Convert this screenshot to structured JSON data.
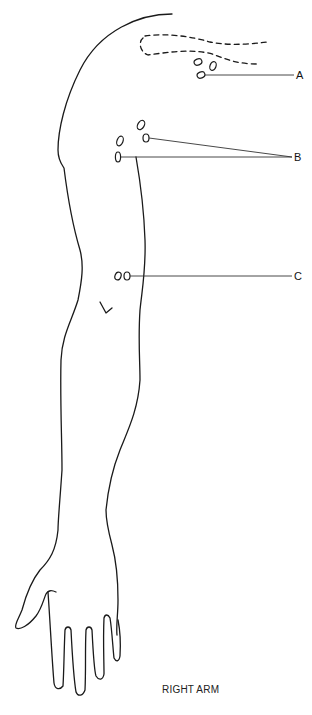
{
  "diagram": {
    "title": "RIGHT ARM",
    "labels": [
      {
        "id": "A",
        "text": "A"
      },
      {
        "id": "B",
        "text": "B"
      },
      {
        "id": "C",
        "text": "C"
      }
    ],
    "markers": {
      "A": {
        "count": 4,
        "description": "cluster of sites near shoulder, below dashed region"
      },
      "B": {
        "count": 4,
        "description": "two pairs of sites on upper arm"
      },
      "C": {
        "count": 2,
        "description": "pair of sites on mid arm"
      }
    },
    "annotations": {
      "dashed_region": "dashed outline on upper shoulder",
      "small_mark": "small check-like mark on forearm"
    },
    "colors": {
      "line": "#1a1a1a",
      "background": "#ffffff"
    }
  }
}
